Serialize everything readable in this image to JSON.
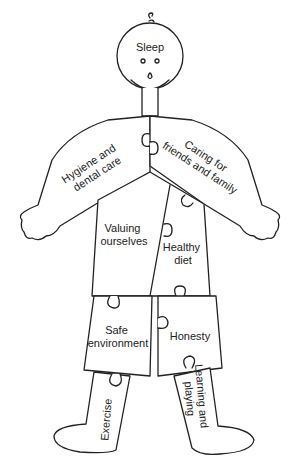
{
  "diagram": {
    "colors": {
      "line": "#222222",
      "background": "#ffffff"
    },
    "pieces": {
      "head": {
        "label": "Sleep"
      },
      "right_arm": {
        "lines": [
          "Hygiene and",
          "dental care"
        ]
      },
      "left_arm": {
        "lines": [
          "Caring for",
          "friends and family"
        ]
      },
      "torso_left": {
        "lines": [
          "Valuing",
          "ourselves"
        ]
      },
      "torso_right": {
        "lines": [
          "Healthy",
          "diet"
        ]
      },
      "shorts_left": {
        "lines": [
          "Safe",
          "environment"
        ]
      },
      "shorts_right": {
        "label": "Honesty"
      },
      "leg_left": {
        "label": "Exercise"
      },
      "leg_right": {
        "lines": [
          "Learning and",
          "playing"
        ]
      }
    }
  }
}
